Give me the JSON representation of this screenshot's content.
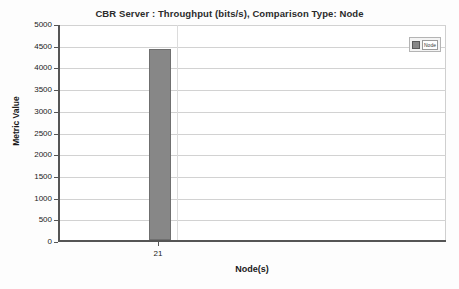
{
  "chart_data": {
    "type": "bar",
    "title": "CBR Server :  Throughput (bits/s), Comparison Type: Node",
    "xlabel": "Node(s)",
    "ylabel": "Metric Value",
    "categories": [
      "21"
    ],
    "values": [
      4400
    ],
    "ylim": [
      0,
      5000
    ],
    "ytick_values": [
      0,
      500,
      1000,
      1500,
      2000,
      2500,
      3000,
      3500,
      4000,
      4500,
      5000
    ],
    "ytick_labels": [
      "0",
      "500",
      "1000",
      "1500",
      "2000",
      "2500",
      "3000",
      "3500",
      "4000",
      "4500",
      "5000"
    ],
    "xtick_labels": [
      "21"
    ],
    "grid": true,
    "grid_axis": "y",
    "legend_position": "top-right",
    "series": [
      {
        "name": "Node",
        "values": [
          4400
        ],
        "color": "#878787"
      }
    ],
    "bar_color": "#878787",
    "bar_edge_color": "#6f6f6f",
    "plot_background": "#ffffff",
    "axis_color": "#555555",
    "gridline_color": "#d2d2d2"
  },
  "legend": {
    "entries": [
      {
        "label": "Node",
        "color": "#878787"
      }
    ]
  }
}
